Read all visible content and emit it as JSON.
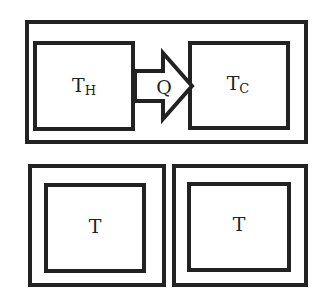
{
  "diagram": {
    "top_system": {
      "hot_body": {
        "label": "T",
        "subscript": "H"
      },
      "cold_body": {
        "label": "T",
        "subscript": "C"
      },
      "heat_flow": {
        "label": "Q",
        "direction": "hot-to-cold"
      }
    },
    "bottom_left": {
      "label": "T"
    },
    "bottom_right": {
      "label": "T"
    },
    "colors": {
      "stroke": "#222222",
      "background": "#ffffff"
    }
  }
}
